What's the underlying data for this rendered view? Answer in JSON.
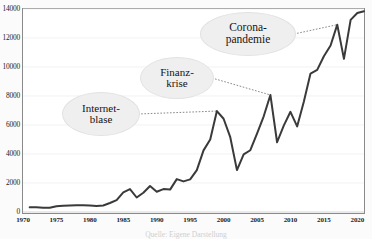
{
  "figure": {
    "background": "#ffffff",
    "frame_color": "#8a8a8a",
    "caption": "Quelle: Eigene Darstellung"
  },
  "chart_data": {
    "type": "line",
    "title": "",
    "xlabel": "",
    "ylabel": "",
    "xlim": [
      1970,
      2021
    ],
    "ylim": [
      0,
      14000
    ],
    "grid": true,
    "grid_axis": "y",
    "legend": "none",
    "line_color": "#3a3a3a",
    "line_width": 2.0,
    "yticks": [
      0,
      2000,
      4000,
      6000,
      8000,
      10000,
      12000,
      14000
    ],
    "ytick_labels": [
      "0",
      "2000",
      "4000",
      "6000",
      "8000",
      "10000",
      "12000",
      "14000"
    ],
    "xticks": [
      1970,
      1975,
      1980,
      1985,
      1990,
      1995,
      2000,
      2005,
      2010,
      2015,
      2020
    ],
    "xtick_labels": [
      "1970",
      "1975",
      "1980",
      "1985",
      "1990",
      "1995",
      "2000",
      "2005",
      "2010",
      "2015",
      "2020"
    ],
    "series": [
      {
        "name": "Index",
        "x": [
          1971,
          1972,
          1973,
          1974,
          1975,
          1976,
          1977,
          1978,
          1979,
          1980,
          1981,
          1982,
          1983,
          1984,
          1985,
          1986,
          1987,
          1988,
          1989,
          1990,
          1991,
          1992,
          1993,
          1994,
          1995,
          1996,
          1997,
          1998,
          1999,
          2000,
          2001,
          2002,
          2003,
          2004,
          2005,
          2006,
          2007,
          2008,
          2009,
          2010,
          2011,
          2012,
          2013,
          2014,
          2015,
          2016,
          2017,
          2018,
          2019,
          2020,
          2021
        ],
        "values": [
          320,
          330,
          300,
          290,
          400,
          430,
          450,
          470,
          460,
          450,
          420,
          450,
          620,
          820,
          1350,
          1580,
          1000,
          1330,
          1790,
          1400,
          1580,
          1545,
          2270,
          2110,
          2250,
          2890,
          4250,
          5000,
          6960,
          6430,
          5160,
          2890,
          3970,
          4260,
          5410,
          6600,
          8070,
          4810,
          5960,
          6910,
          5900,
          7610,
          9550,
          9800,
          10740,
          11480,
          12920,
          10560,
          13250,
          13720,
          13850
        ]
      }
    ],
    "annotations": [
      {
        "id": "internet-blase",
        "lines": [
          "Internet-",
          "blase"
        ],
        "points_to_year": 1999,
        "points_to_value": 6960
      },
      {
        "id": "finanzkrise",
        "lines": [
          "Finanz-",
          "krise"
        ],
        "points_to_year": 2007,
        "points_to_value": 8070
      },
      {
        "id": "corona-pandemie",
        "lines": [
          "Corona-",
          "pandemie"
        ],
        "points_to_year": 2017,
        "points_to_value": 12920
      }
    ]
  }
}
